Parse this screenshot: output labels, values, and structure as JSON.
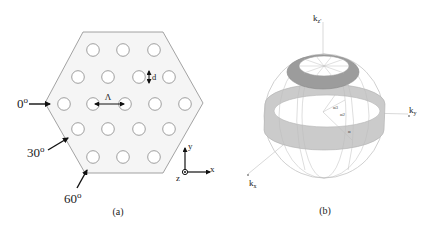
{
  "figure": {
    "panel_a": {
      "caption": "(a)",
      "description": "Hexagonal photonic crystal slab with triangular lattice of circular holes",
      "lattice_label": "Λ",
      "diameter_label": "d",
      "incidence_angles": [
        {
          "value": "0",
          "unit": "o"
        },
        {
          "value": "30",
          "unit": "o"
        },
        {
          "value": "60",
          "unit": "o"
        }
      ],
      "axes": {
        "x": "x",
        "y": "y",
        "z": "z"
      },
      "hole_rows": [
        {
          "y": 50,
          "xs": [
            93,
            123,
            154
          ]
        },
        {
          "y": 77,
          "xs": [
            78,
            108,
            139,
            169
          ]
        },
        {
          "y": 104,
          "xs": [
            64,
            93,
            125,
            155,
            185
          ]
        },
        {
          "y": 129,
          "xs": [
            78,
            108,
            139,
            169
          ]
        },
        {
          "y": 157,
          "xs": [
            93,
            123,
            154
          ]
        }
      ],
      "colors": {
        "slab_fill": "#f4f4f4",
        "outline": "#8a8a8a",
        "arrow": "#111111"
      }
    },
    "panel_b": {
      "caption": "(b)",
      "description": "Wave-vector sphere with shaded bands",
      "axis_labels": {
        "kz": "k",
        "kz_sub": "z'",
        "ky": "k",
        "ky_sub": "y",
        "kx": "k",
        "kx_sub": "x"
      },
      "angle_labels": [
        "α3",
        "α2",
        "α"
      ],
      "colors": {
        "top_ring": "#9a9a9a",
        "mid_band": "#c8c8c8",
        "wire": "#b8b8b8",
        "axis": "#cfcfcf"
      }
    }
  }
}
